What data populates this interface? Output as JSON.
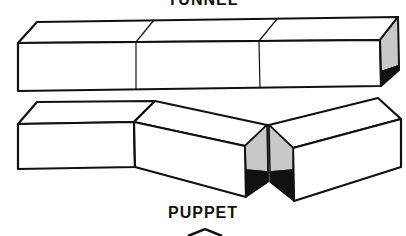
{
  "labels": {
    "top": "TUNNEL",
    "bottom": "PUPPET"
  },
  "figures": [
    {
      "name": "tunnel",
      "description": "three connected rectangular box segments in a straight line",
      "segments": 3
    },
    {
      "name": "puppet",
      "description": "three box segments bent into a V-shaped hinge, shaded open end",
      "segments": 3
    }
  ],
  "colors": {
    "line": "#111111",
    "shade_light": "#c8c8c8",
    "shade_dark": "#111111",
    "background": "#ffffff"
  }
}
